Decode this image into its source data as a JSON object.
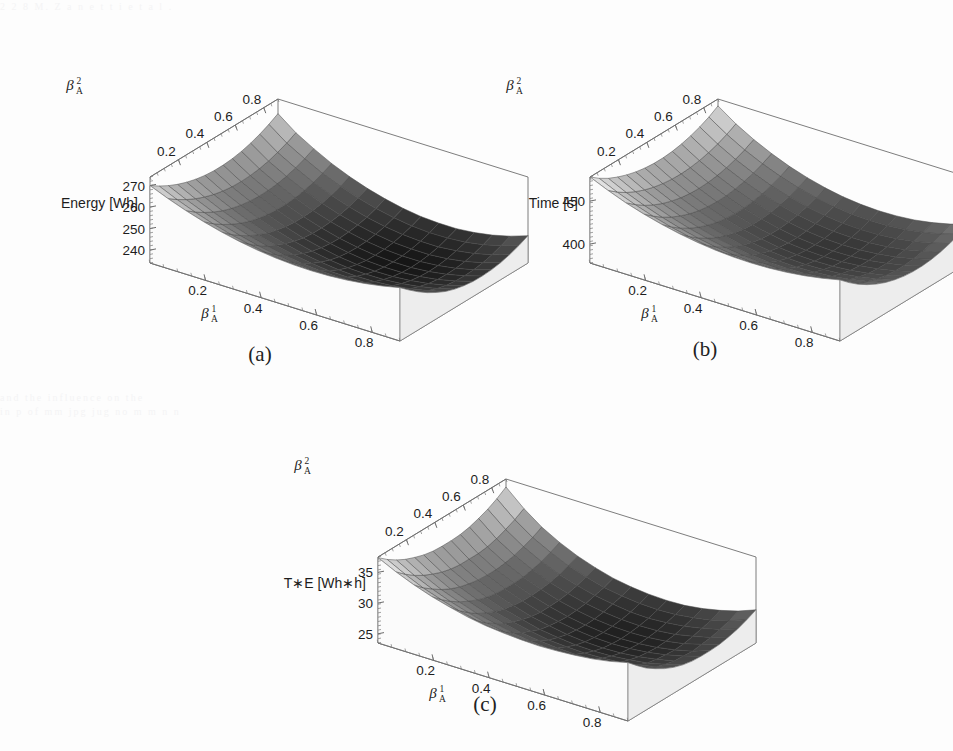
{
  "figure": {
    "background_color": "#fdfdfd",
    "surface_dark_color": "#151515",
    "surface_light_color": "#f2f2f2",
    "mesh_line_color": "#4a4a4a",
    "axis_color": "#6e6e6e"
  },
  "bleed": {
    "line1": "2 2 8   M. Z a n e t t i   e t   a l .",
    "line2": "and the  influence  on  the",
    "line3": "in   p       of  mm jpg   jug     no     m      m n   n"
  },
  "captions": {
    "a": "(a)",
    "b": "(b)",
    "c": "(c)"
  },
  "axes_labels": {
    "beta1": {
      "base": "β",
      "sup": "1",
      "sub": "A"
    },
    "beta2": {
      "base": "β",
      "sup": "2",
      "sub": "A"
    }
  },
  "chart_data": [
    {
      "id": "a",
      "type": "surface",
      "title": "(a)",
      "xlabel": "βᴬ¹",
      "ylabel": "βᴬ²",
      "zlabel": "Energy [Wh]",
      "xlabel_plain": "beta_A^1",
      "ylabel_plain": "beta_A^2",
      "xticks": [
        "0.2",
        "0.4",
        "0.6",
        "0.8"
      ],
      "yticks": [
        "0.2",
        "0.4",
        "0.6",
        "0.8"
      ],
      "zticks": [
        "240",
        "250",
        "260",
        "270"
      ],
      "xlim": [
        0.0,
        0.9
      ],
      "ylim": [
        0.0,
        0.9
      ],
      "zlim": [
        234,
        274
      ],
      "grid": true,
      "legend": "none",
      "nx": 15,
      "ny": 15,
      "z_matrix": [
        [
          270.0,
          266.6,
          263.6,
          261.0,
          258.8,
          257.0,
          255.6,
          254.6,
          254.0,
          253.8,
          254.0,
          254.6,
          255.6,
          257.0,
          258.8
        ],
        [
          267.2,
          263.5,
          260.3,
          257.5,
          255.1,
          253.2,
          251.7,
          250.6,
          249.9,
          249.7,
          249.9,
          250.6,
          251.7,
          253.2,
          255.1
        ],
        [
          264.8,
          260.9,
          257.5,
          254.5,
          252.0,
          249.9,
          248.3,
          247.1,
          246.4,
          246.1,
          246.3,
          247.0,
          248.1,
          249.7,
          251.7
        ],
        [
          262.8,
          258.7,
          255.1,
          252.0,
          249.3,
          247.1,
          245.4,
          244.1,
          243.3,
          243.0,
          243.2,
          243.9,
          245.0,
          246.6,
          248.7
        ],
        [
          261.2,
          256.9,
          253.1,
          249.9,
          247.1,
          244.8,
          243.0,
          241.6,
          240.7,
          240.4,
          240.5,
          241.2,
          242.4,
          244.0,
          246.2
        ],
        [
          260.0,
          255.5,
          251.6,
          248.2,
          245.3,
          242.9,
          241.0,
          239.6,
          238.6,
          238.2,
          238.3,
          239.0,
          240.2,
          241.9,
          244.1
        ],
        [
          259.2,
          254.5,
          250.5,
          247.0,
          244.0,
          241.5,
          239.5,
          238.0,
          237.0,
          236.6,
          236.7,
          237.4,
          238.6,
          240.3,
          242.6
        ],
        [
          258.8,
          253.9,
          249.8,
          246.2,
          243.1,
          240.5,
          238.5,
          236.9,
          235.9,
          235.4,
          235.5,
          236.2,
          237.4,
          239.2,
          241.6
        ],
        [
          258.8,
          253.7,
          249.5,
          245.8,
          242.6,
          240.0,
          237.9,
          236.3,
          235.2,
          234.7,
          234.8,
          235.5,
          236.7,
          238.6,
          241.0
        ],
        [
          259.2,
          253.9,
          249.6,
          245.8,
          242.6,
          239.9,
          237.7,
          236.1,
          235.0,
          234.5,
          234.5,
          235.2,
          236.5,
          238.4,
          240.9
        ],
        [
          260.0,
          254.5,
          250.1,
          246.2,
          242.9,
          240.2,
          238.0,
          236.3,
          235.2,
          234.7,
          234.7,
          235.4,
          236.7,
          238.6,
          241.2
        ],
        [
          261.2,
          255.5,
          251.0,
          247.0,
          243.7,
          240.9,
          238.7,
          237.0,
          235.8,
          235.3,
          235.3,
          236.0,
          237.3,
          239.3,
          241.9
        ],
        [
          262.8,
          256.9,
          252.3,
          248.2,
          244.8,
          242.0,
          239.7,
          238.0,
          236.9,
          236.3,
          236.3,
          237.1,
          238.4,
          240.4,
          243.1
        ],
        [
          264.8,
          258.7,
          254.0,
          249.8,
          246.4,
          243.5,
          241.2,
          239.5,
          238.3,
          237.7,
          237.8,
          238.5,
          239.9,
          242.0,
          244.7
        ],
        [
          267.2,
          260.9,
          256.1,
          251.8,
          248.3,
          245.4,
          243.1,
          241.3,
          240.1,
          239.6,
          239.6,
          240.4,
          241.8,
          243.9,
          246.7
        ]
      ]
    },
    {
      "id": "b",
      "type": "surface",
      "title": "(b)",
      "xlabel": "βᴬ¹",
      "ylabel": "βᴬ²",
      "zlabel": "Time [s]",
      "xlabel_plain": "beta_A^1",
      "ylabel_plain": "beta_A^2",
      "xticks": [
        "0.2",
        "0.4",
        "0.6",
        "0.8"
      ],
      "yticks": [
        "0.2",
        "0.4",
        "0.6",
        "0.8"
      ],
      "zticks": [
        "400",
        "450"
      ],
      "xlim": [
        0.0,
        0.9
      ],
      "ylim": [
        0.0,
        0.9
      ],
      "zlim": [
        378,
        478
      ],
      "grid": true,
      "legend": "none",
      "nx": 15,
      "ny": 15,
      "z_matrix": [
        [
          478.0,
          469.0,
          461.0,
          454.5,
          449.0,
          444.5,
          441.0,
          438.5,
          437.0,
          436.5,
          437.0,
          438.5,
          441.0,
          444.5,
          449.0
        ],
        [
          470.0,
          460.5,
          452.5,
          445.5,
          439.5,
          434.8,
          431.0,
          428.4,
          426.8,
          426.2,
          426.7,
          428.3,
          430.9,
          434.6,
          439.4
        ],
        [
          463.5,
          453.5,
          445.0,
          437.7,
          431.5,
          426.5,
          422.6,
          419.8,
          418.1,
          417.5,
          418.0,
          419.6,
          422.3,
          426.1,
          431.0
        ],
        [
          458.5,
          448.0,
          439.0,
          431.4,
          424.9,
          419.7,
          415.6,
          412.7,
          410.9,
          410.3,
          410.8,
          412.4,
          415.2,
          419.1,
          424.1
        ],
        [
          454.5,
          443.5,
          434.2,
          426.2,
          419.5,
          414.0,
          409.8,
          406.8,
          404.9,
          404.3,
          404.8,
          406.4,
          409.2,
          413.2,
          418.3
        ],
        [
          451.5,
          440.2,
          430.5,
          422.2,
          415.2,
          409.6,
          405.2,
          402.0,
          400.1,
          399.4,
          399.9,
          401.5,
          404.4,
          408.5,
          413.7
        ],
        [
          449.5,
          437.9,
          427.9,
          419.3,
          412.1,
          406.3,
          401.8,
          398.5,
          396.5,
          395.8,
          396.3,
          397.9,
          400.9,
          405.1,
          410.4
        ],
        [
          448.5,
          436.6,
          426.3,
          417.5,
          410.1,
          404.1,
          399.5,
          396.1,
          394.1,
          393.3,
          393.8,
          395.5,
          398.5,
          402.7,
          408.1
        ],
        [
          448.5,
          436.3,
          425.8,
          416.8,
          409.2,
          403.1,
          398.4,
          394.9,
          392.8,
          392.0,
          392.5,
          394.2,
          397.2,
          401.5,
          407.0
        ],
        [
          449.5,
          437.0,
          426.3,
          417.1,
          409.4,
          403.2,
          398.4,
          394.8,
          392.7,
          391.9,
          392.3,
          394.0,
          397.1,
          401.4,
          407.0
        ],
        [
          451.5,
          438.7,
          427.8,
          418.5,
          410.7,
          404.3,
          399.4,
          395.8,
          393.6,
          392.7,
          393.2,
          394.9,
          398.0,
          402.4,
          408.1
        ],
        [
          454.5,
          441.4,
          430.3,
          420.9,
          412.9,
          406.5,
          401.5,
          397.8,
          395.5,
          394.6,
          395.1,
          396.8,
          400.0,
          404.5,
          410.3
        ],
        [
          458.5,
          445.1,
          433.8,
          424.2,
          416.1,
          409.6,
          404.5,
          400.7,
          398.4,
          397.5,
          398.0,
          399.7,
          403.0,
          407.6,
          413.5
        ],
        [
          463.5,
          449.8,
          438.3,
          428.6,
          420.4,
          413.7,
          408.5,
          404.7,
          402.3,
          401.4,
          401.9,
          403.7,
          407.0,
          411.7,
          417.7
        ],
        [
          470.0,
          455.6,
          443.9,
          434.0,
          425.6,
          418.9,
          413.6,
          409.7,
          407.3,
          406.3,
          406.8,
          408.6,
          412.0,
          416.8,
          423.0
        ]
      ]
    },
    {
      "id": "c",
      "type": "surface",
      "title": "(c)",
      "xlabel": "βᴬ¹",
      "ylabel": "βᴬ²",
      "zlabel": "T∗E [Wh∗h]",
      "xlabel_plain": "beta_A^1",
      "ylabel_plain": "beta_A^2",
      "xticks": [
        "0.2",
        "0.4",
        "0.6",
        "0.8"
      ],
      "yticks": [
        "0.2",
        "0.4",
        "0.6",
        "0.8"
      ],
      "zticks": [
        "25",
        "30",
        "35"
      ],
      "xlim": [
        0.0,
        0.9
      ],
      "ylim": [
        0.0,
        0.9
      ],
      "zlim": [
        23.5,
        37.5
      ],
      "grid": true,
      "legend": "none",
      "nx": 15,
      "ny": 15,
      "z_matrix": [
        [
          37.4,
          36.0,
          34.8,
          33.8,
          33.0,
          32.3,
          31.8,
          31.5,
          31.3,
          31.2,
          31.3,
          31.5,
          31.8,
          32.3,
          33.0
        ],
        [
          36.2,
          34.7,
          33.4,
          32.4,
          31.5,
          30.8,
          30.3,
          29.9,
          29.7,
          29.7,
          29.8,
          30.0,
          30.4,
          30.9,
          31.6
        ],
        [
          35.2,
          33.6,
          32.3,
          31.2,
          30.3,
          29.5,
          29.0,
          28.6,
          28.3,
          28.3,
          28.4,
          28.6,
          29.0,
          29.6,
          30.3
        ],
        [
          34.4,
          32.7,
          31.3,
          30.2,
          29.2,
          28.5,
          27.9,
          27.5,
          27.2,
          27.2,
          27.3,
          27.5,
          27.9,
          28.5,
          29.3
        ],
        [
          33.8,
          32.0,
          30.5,
          29.4,
          28.4,
          27.6,
          27.0,
          26.6,
          26.3,
          26.2,
          26.3,
          26.6,
          27.0,
          27.6,
          28.4
        ],
        [
          33.3,
          31.4,
          29.9,
          28.7,
          27.7,
          26.9,
          26.3,
          25.8,
          25.6,
          25.5,
          25.6,
          25.8,
          26.3,
          26.9,
          27.7
        ],
        [
          33.0,
          31.0,
          29.5,
          28.2,
          27.2,
          26.4,
          25.7,
          25.3,
          25.0,
          24.9,
          25.0,
          25.3,
          25.7,
          26.4,
          27.2
        ],
        [
          32.9,
          30.8,
          29.2,
          27.9,
          26.9,
          26.0,
          25.4,
          24.9,
          24.6,
          24.5,
          24.6,
          24.9,
          25.4,
          26.0,
          26.9
        ],
        [
          32.9,
          30.8,
          29.1,
          27.8,
          26.7,
          25.8,
          25.2,
          24.7,
          24.4,
          24.3,
          24.4,
          24.7,
          25.2,
          25.9,
          26.8
        ],
        [
          33.0,
          30.8,
          29.1,
          27.8,
          26.7,
          25.8,
          25.1,
          24.6,
          24.3,
          24.2,
          24.3,
          24.6,
          25.1,
          25.8,
          26.8
        ],
        [
          33.3,
          31.0,
          29.3,
          27.9,
          26.8,
          25.9,
          25.2,
          24.7,
          24.4,
          24.3,
          24.4,
          24.7,
          25.2,
          26.0,
          26.9
        ],
        [
          33.8,
          31.4,
          29.6,
          28.2,
          27.0,
          26.1,
          25.4,
          24.9,
          24.6,
          24.5,
          24.6,
          24.9,
          25.5,
          26.2,
          27.2
        ],
        [
          34.4,
          32.0,
          30.1,
          28.6,
          27.4,
          26.5,
          25.8,
          25.3,
          24.9,
          24.8,
          25.0,
          25.3,
          25.9,
          26.6,
          27.6
        ],
        [
          35.2,
          32.7,
          30.7,
          29.2,
          27.9,
          27.0,
          26.2,
          25.7,
          25.4,
          25.3,
          25.4,
          25.8,
          26.3,
          27.1,
          28.2
        ],
        [
          36.2,
          33.6,
          31.5,
          29.9,
          28.6,
          27.6,
          26.8,
          26.3,
          26.0,
          25.9,
          26.0,
          26.4,
          27.0,
          27.8,
          28.9
        ]
      ]
    }
  ]
}
